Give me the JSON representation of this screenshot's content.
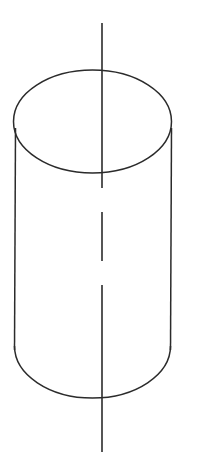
{
  "figure": {
    "kind": "technical-line-drawing",
    "subject_label": "cylinder",
    "canvas": {
      "width": 205,
      "height": 458,
      "background_color": "#ffffff"
    },
    "style": {
      "line_color": "#2b2b2b",
      "outline_stroke_width": 1.5,
      "axis_stroke_width": 1.6,
      "fill": "none"
    },
    "geometry": {
      "top_ellipse": {
        "center_x": 92.5,
        "center_y": 121.5,
        "radius_x": 79,
        "radius_y": 51.5,
        "top_y": 70,
        "bottom_y": 173,
        "left_x": 13.5,
        "right_x": 171.5,
        "visible": "full"
      },
      "bottom_ellipse": {
        "center_x": 92.5,
        "center_y": 346,
        "radius_x": 78,
        "radius_y": 52,
        "bottom_y": 398,
        "left_x": 14.5,
        "right_x": 170.5,
        "visible": "front-half-only"
      },
      "left_wall": {
        "top_x": 15.5,
        "top_y": 128,
        "bottom_x": 14.5,
        "bottom_y": 350
      },
      "right_wall": {
        "top_x": 171.5,
        "top_y": 128,
        "bottom_x": 170.5,
        "bottom_y": 350
      },
      "body_height": 224
    },
    "center_axis": {
      "x": 102,
      "start_y": 23,
      "end_y": 452,
      "line_style": "center-line-with-breaks",
      "segments": [
        {
          "from_y": 23,
          "to_y": 188
        },
        {
          "from_y": 212,
          "to_y": 261
        },
        {
          "from_y": 285,
          "to_y": 452
        }
      ],
      "gaps": [
        {
          "from_y": 188,
          "to_y": 212
        },
        {
          "from_y": 261,
          "to_y": 285
        }
      ]
    },
    "labels": {
      "title": "",
      "annotations": [],
      "dimension_text": []
    }
  }
}
